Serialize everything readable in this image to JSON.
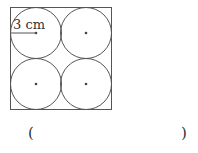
{
  "figure": {
    "radius_label": "3 cm",
    "circle_count": 4,
    "stroke_color": "#555555"
  },
  "answer": {
    "open_paren": "(",
    "close_paren": ")",
    "value": ""
  }
}
